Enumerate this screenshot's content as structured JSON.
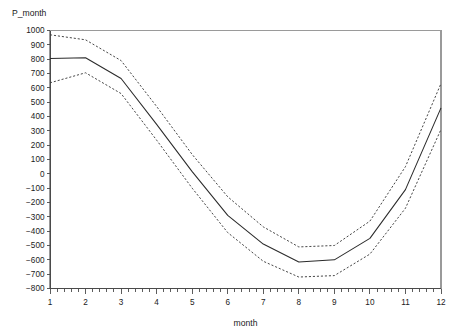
{
  "chart_data": {
    "type": "line",
    "title": "",
    "xlabel": "month",
    "ylabel": "P_month",
    "x": [
      1,
      2,
      3,
      4,
      5,
      6,
      7,
      8,
      9,
      10,
      11,
      12
    ],
    "xlim": [
      1,
      12
    ],
    "ylim": [
      -800,
      1000
    ],
    "grid": false,
    "legend": null,
    "xticklabels": [
      "1",
      "2",
      "3",
      "4",
      "5",
      "6",
      "7",
      "8",
      "9",
      "10",
      "11",
      "12"
    ],
    "yticklabels": [
      "1000",
      "900",
      "800",
      "700",
      "600",
      "500",
      "400",
      "300",
      "200",
      "100",
      "0",
      "-100",
      "-200",
      "-300",
      "-400",
      "-500",
      "-600",
      "-700",
      "-800"
    ],
    "ytickvalues": [
      1000,
      900,
      800,
      700,
      600,
      500,
      400,
      300,
      200,
      100,
      0,
      -100,
      -200,
      -300,
      -400,
      -500,
      -600,
      -700,
      -800
    ],
    "series": [
      {
        "name": "upper confidence limit",
        "style": "dashed",
        "values": [
          970,
          935,
          790,
          470,
          135,
          -160,
          -370,
          -510,
          -500,
          -330,
          50,
          630
        ]
      },
      {
        "name": "predicted P_month",
        "style": "solid",
        "values": [
          805,
          810,
          665,
          345,
          15,
          -290,
          -490,
          -615,
          -600,
          -450,
          -110,
          460
        ]
      },
      {
        "name": "lower confidence limit",
        "style": "dashed",
        "values": [
          635,
          705,
          560,
          235,
          -100,
          -410,
          -610,
          -720,
          -710,
          -560,
          -240,
          310
        ]
      }
    ]
  }
}
